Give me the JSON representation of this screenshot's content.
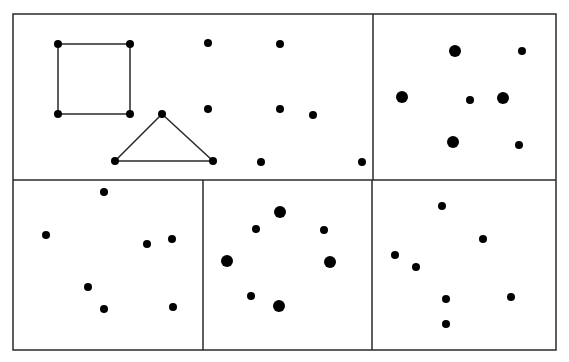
{
  "figure": {
    "width": 569,
    "height": 362,
    "background": "#ffffff",
    "line_color": "#2a2a2a",
    "dot_color": "#000000"
  },
  "frame": {
    "x1": 13,
    "y1": 14,
    "x2": 556,
    "y2": 350
  },
  "dividers": [
    {
      "name": "top-row-vertical-divider",
      "x1": 373,
      "y1": 14,
      "x2": 373,
      "y2": 180
    },
    {
      "name": "horizontal-divider",
      "x1": 13,
      "y1": 180,
      "x2": 556,
      "y2": 180
    },
    {
      "name": "bottom-row-left-divider",
      "x1": 203,
      "y1": 180,
      "x2": 203,
      "y2": 350
    },
    {
      "name": "bottom-row-right-divider",
      "x1": 372,
      "y1": 180,
      "x2": 372,
      "y2": 350
    }
  ],
  "panels": [
    {
      "name": "panel-top-left",
      "shapes": [
        {
          "type": "polygon",
          "name": "square",
          "points": [
            [
              58,
              44
            ],
            [
              130,
              44
            ],
            [
              130,
              114
            ],
            [
              58,
              114
            ]
          ]
        },
        {
          "type": "polygon",
          "name": "triangle",
          "points": [
            [
              162,
              114
            ],
            [
              213,
              161
            ],
            [
              115,
              161
            ]
          ]
        }
      ],
      "dots": [
        {
          "x": 58,
          "y": 44,
          "r": 4
        },
        {
          "x": 130,
          "y": 44,
          "r": 4
        },
        {
          "x": 58,
          "y": 114,
          "r": 4
        },
        {
          "x": 130,
          "y": 114,
          "r": 4
        },
        {
          "x": 162,
          "y": 114,
          "r": 4
        },
        {
          "x": 115,
          "y": 161,
          "r": 4
        },
        {
          "x": 213,
          "y": 161,
          "r": 4
        },
        {
          "x": 208,
          "y": 43,
          "r": 4
        },
        {
          "x": 280,
          "y": 44,
          "r": 4
        },
        {
          "x": 208,
          "y": 109,
          "r": 4
        },
        {
          "x": 280,
          "y": 109,
          "r": 4
        },
        {
          "x": 313,
          "y": 115,
          "r": 4
        },
        {
          "x": 261,
          "y": 162,
          "r": 4
        },
        {
          "x": 362,
          "y": 162,
          "r": 4
        }
      ]
    },
    {
      "name": "panel-top-right",
      "shapes": [],
      "dots": [
        {
          "x": 455,
          "y": 51,
          "r": 6
        },
        {
          "x": 522,
          "y": 51,
          "r": 4
        },
        {
          "x": 402,
          "y": 97,
          "r": 6
        },
        {
          "x": 470,
          "y": 100,
          "r": 4
        },
        {
          "x": 503,
          "y": 98,
          "r": 6
        },
        {
          "x": 453,
          "y": 142,
          "r": 6
        },
        {
          "x": 519,
          "y": 145,
          "r": 4
        }
      ]
    },
    {
      "name": "panel-bottom-left",
      "shapes": [],
      "dots": [
        {
          "x": 104,
          "y": 192,
          "r": 4
        },
        {
          "x": 46,
          "y": 235,
          "r": 4
        },
        {
          "x": 147,
          "y": 244,
          "r": 4
        },
        {
          "x": 172,
          "y": 239,
          "r": 4
        },
        {
          "x": 88,
          "y": 287,
          "r": 4
        },
        {
          "x": 104,
          "y": 309,
          "r": 4
        },
        {
          "x": 173,
          "y": 307,
          "r": 4
        }
      ]
    },
    {
      "name": "panel-bottom-middle",
      "shapes": [],
      "dots": [
        {
          "x": 280,
          "y": 212,
          "r": 6
        },
        {
          "x": 256,
          "y": 229,
          "r": 4
        },
        {
          "x": 324,
          "y": 230,
          "r": 4
        },
        {
          "x": 227,
          "y": 261,
          "r": 6
        },
        {
          "x": 330,
          "y": 262,
          "r": 6
        },
        {
          "x": 251,
          "y": 296,
          "r": 4
        },
        {
          "x": 279,
          "y": 306,
          "r": 6
        }
      ]
    },
    {
      "name": "panel-bottom-right",
      "shapes": [],
      "dots": [
        {
          "x": 442,
          "y": 206,
          "r": 4
        },
        {
          "x": 483,
          "y": 239,
          "r": 4
        },
        {
          "x": 395,
          "y": 255,
          "r": 4
        },
        {
          "x": 416,
          "y": 267,
          "r": 4
        },
        {
          "x": 446,
          "y": 299,
          "r": 4
        },
        {
          "x": 511,
          "y": 297,
          "r": 4
        },
        {
          "x": 446,
          "y": 324,
          "r": 4
        }
      ]
    }
  ]
}
